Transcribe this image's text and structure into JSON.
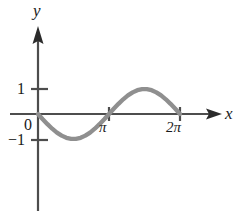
{
  "figure": {
    "background_color": "#ffffff",
    "axis_color": "#4d4d4d",
    "curve_color": "#8f8f8f",
    "text_color": "#1a1a1a"
  },
  "labels": {
    "y_axis": "y",
    "x_axis": "x",
    "origin": "0",
    "y_tick_one": "1",
    "y_tick_neg_one": "−1",
    "x_tick_pi": "π",
    "x_tick_two_pi": "2π"
  },
  "chart_data": {
    "type": "line",
    "title": "",
    "subtitle": "",
    "xlabel": "x",
    "ylabel": "y",
    "function": "y = sin(x)",
    "grid": false,
    "legend": null,
    "xlim": [
      -1.1,
      7.9
    ],
    "ylim": [
      -2.0,
      3.5
    ],
    "xticks": [
      3.141592653589793,
      6.283185307179586
    ],
    "xticklabels": [
      "π",
      "2π"
    ],
    "yticks": [
      -1,
      0,
      1
    ],
    "yticklabels": [
      "−1",
      "0",
      "1"
    ],
    "series": [
      {
        "name": "sin(x)",
        "color": "#8f8f8f",
        "linewidth": 4,
        "x": [
          0.0,
          0.2094,
          0.4189,
          0.6283,
          0.8378,
          1.0472,
          1.2566,
          1.4661,
          1.6755,
          1.885,
          2.0944,
          2.3038,
          2.5133,
          2.7227,
          2.9322,
          3.1416,
          3.351,
          3.5605,
          3.7699,
          3.9794,
          4.1888,
          4.3982,
          4.6077,
          4.8171,
          5.0265,
          5.236,
          5.4454,
          5.6549,
          5.8643,
          6.0737,
          6.2832
        ],
        "y": [
          0.0,
          -0.2079,
          -0.4067,
          -0.5878,
          -0.7431,
          -0.866,
          -0.9511,
          -0.9945,
          -0.9945,
          -0.9511,
          -0.866,
          -0.7431,
          -0.5878,
          -0.4067,
          -0.2079,
          0.0,
          0.2079,
          0.4067,
          0.5878,
          0.7431,
          0.866,
          0.9511,
          0.9945,
          0.9945,
          0.9511,
          0.866,
          0.7431,
          0.5878,
          0.4067,
          0.2079,
          0.0
        ]
      }
    ],
    "annotations": [
      {
        "name": "x-axis-arrow",
        "at_x": 7.9,
        "at_y": 0
      },
      {
        "name": "y-axis-arrow",
        "at_x": 0,
        "at_y": 3.5
      }
    ],
    "note": "Sine wave drawn from x = 0 to x = 2π; one full period with trough of -1 near x = π/2... (minimum between 0 and π) and crest of +1 between π and 2π."
  }
}
